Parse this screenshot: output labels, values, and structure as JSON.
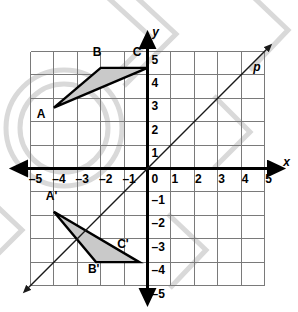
{
  "figure": {
    "background_color": "#ffffff",
    "watermark_color": "#d8d8d8"
  },
  "grid": {
    "x_min": -5,
    "x_max": 5,
    "y_min": -5,
    "y_max": 5,
    "step": 1,
    "grid_color": "#7a7a7a",
    "axis_color": "#000000",
    "show_grid": true
  },
  "axes": {
    "x_label": "x",
    "y_label": "y",
    "origin_label": "0",
    "x_tick_labels": [
      "–5",
      "–4",
      "–3",
      "–2",
      "–1",
      "1",
      "2",
      "3",
      "4",
      "5"
    ],
    "x_tick_values": [
      -5,
      -4,
      -3,
      -2,
      -1,
      1,
      2,
      3,
      4,
      5
    ],
    "y_tick_labels": [
      "5",
      "4",
      "3",
      "2",
      "1",
      "–1",
      "–2",
      "–3",
      "–4",
      "–5"
    ],
    "y_tick_values": [
      5,
      4,
      3,
      2,
      1,
      -1,
      -2,
      -3,
      -4,
      -5
    ]
  },
  "line_p": {
    "label": "p",
    "equation": "y = x",
    "slope": 1,
    "intercept": 0,
    "from": [
      -5.2,
      -5.2
    ],
    "to": [
      5.2,
      5.2
    ],
    "color": "#1a1a1a",
    "arrows": "both"
  },
  "shapes": [
    {
      "name": "triangle-abc",
      "fill": "#c9c9c9",
      "stroke": "#000000",
      "vertices": [
        {
          "label": "A",
          "x": -4,
          "y": 2.6,
          "label_dx": -0.55,
          "label_dy": -0.45
        },
        {
          "label": "B",
          "x": -2,
          "y": 4.3,
          "label_dx": -0.15,
          "label_dy": 0.5
        },
        {
          "label": "C",
          "x": 0,
          "y": 4.3,
          "label_dx": -0.45,
          "label_dy": 0.5
        }
      ]
    },
    {
      "name": "triangle-a-prime-b-prime-c-prime",
      "fill": "#c9c9c9",
      "stroke": "#000000",
      "vertices": [
        {
          "label": "A'",
          "x": -4.0,
          "y": -1.85,
          "label_dx": -0.1,
          "label_dy": 0.5
        },
        {
          "label": "B'",
          "x": -2.2,
          "y": -4.0,
          "label_dx": -0.1,
          "label_dy": -0.45
        },
        {
          "label": "C'",
          "x": -0.35,
          "y": -4.0,
          "label_dx": -0.7,
          "label_dy": 0.62
        }
      ]
    }
  ],
  "chart_data": {
    "type": "scatter",
    "xlabel": "x",
    "ylabel": "y",
    "xlim": [
      -5,
      5
    ],
    "ylim": [
      -5,
      5
    ],
    "grid": true,
    "legend": "none",
    "annotations": [
      "A",
      "B",
      "C",
      "A'",
      "B'",
      "C'",
      "p"
    ],
    "series": [
      {
        "name": "Triangle ABC",
        "points": [
          {
            "label": "A",
            "x": -4,
            "y": 2.6
          },
          {
            "label": "B",
            "x": -2,
            "y": 4.3
          },
          {
            "label": "C",
            "x": 0,
            "y": 4.3
          }
        ]
      },
      {
        "name": "Triangle A'B'C'",
        "points": [
          {
            "label": "A'",
            "x": -4.0,
            "y": -1.85
          },
          {
            "label": "B'",
            "x": -2.2,
            "y": -4.0
          },
          {
            "label": "C'",
            "x": -0.35,
            "y": -4.0
          }
        ]
      },
      {
        "name": "line p",
        "points": [
          {
            "label": "p-start",
            "x": -5.2,
            "y": -5.2
          },
          {
            "label": "p-end",
            "x": 5.2,
            "y": 5.2
          }
        ]
      }
    ]
  }
}
